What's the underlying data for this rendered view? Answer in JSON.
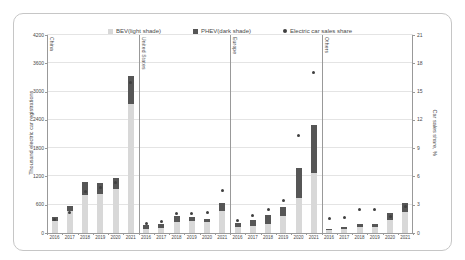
{
  "chart_data": {
    "type": "bar",
    "subtype": "stacked-bars-with-share-dots",
    "title": "",
    "legend": [
      {
        "label": "BEV(light shade)",
        "marker": "square",
        "color": "#d8d8d8"
      },
      {
        "label": "PHEV(dark shade)",
        "marker": "square",
        "color": "#565656"
      },
      {
        "label": "Electric car sales share",
        "marker": "circle",
        "color": "#3f3f3f"
      }
    ],
    "left_axis": {
      "label": "Thousand electric car registrations",
      "min": 0,
      "max": 4200,
      "step": 600
    },
    "right_axis": {
      "label": "Car sales share, %",
      "min": 0,
      "max": 21,
      "step": 3
    },
    "grid": true,
    "categories": [
      "2016",
      "2017",
      "2018",
      "2019",
      "2020",
      "2021"
    ],
    "regions": [
      {
        "name": "China",
        "bev": [
          255,
          470,
          810,
          835,
          930,
          2735
        ],
        "phev": [
          80,
          110,
          270,
          225,
          230,
          600
        ],
        "share": [
          1.4,
          2.2,
          4.4,
          4.8,
          5.4,
          16
        ]
      },
      {
        "name": "United States",
        "bev": [
          90,
          105,
          240,
          245,
          230,
          470
        ],
        "phev": [
          70,
          95,
          120,
          85,
          65,
          160
        ],
        "share": [
          1.0,
          1.2,
          2.1,
          2.1,
          2.2,
          4.5
        ]
      },
      {
        "name": "Europe",
        "bev": [
          120,
          150,
          200,
          360,
          750,
          1270
        ],
        "phev": [
          100,
          130,
          185,
          200,
          620,
          1020
        ],
        "share": [
          1.3,
          1.9,
          2.5,
          3.5,
          10.3,
          17
        ]
      },
      {
        "name": "Others",
        "bev": [
          55,
          85,
          130,
          130,
          280,
          450
        ],
        "phev": [
          30,
          40,
          70,
          60,
          140,
          180
        ],
        "share": [
          1.5,
          1.6,
          2.5,
          2.5,
          1.8,
          2.8
        ]
      }
    ],
    "colors": {
      "bev": "#d8d8d8",
      "phev": "#565656",
      "dot": "#3f3f3f",
      "gridline": "#e4e4e4",
      "axis_line": "#999999",
      "text": "#4a4a4a",
      "card_border": "#c6c6c6"
    }
  }
}
